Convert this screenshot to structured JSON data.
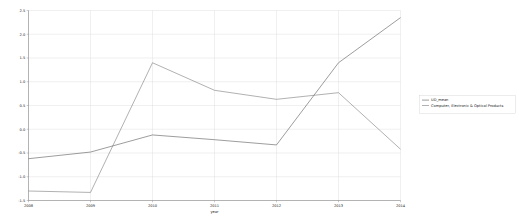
{
  "chart_data": {
    "type": "line",
    "title": "",
    "xlabel": "year",
    "ylabel": "",
    "x": [
      2008,
      2009,
      2010,
      2011,
      2012,
      2013,
      2014
    ],
    "xticklabels": [
      "2008",
      "2009",
      "2010",
      "2011",
      "2012",
      "2013",
      "2014"
    ],
    "xlim": [
      2008,
      2014
    ],
    "ylim": [
      -1.5,
      2.5
    ],
    "yticks": [
      -1.5,
      -1.0,
      -0.5,
      0.0,
      0.5,
      1.0,
      1.5,
      2.0,
      2.5
    ],
    "yticklabels": [
      "-1.5",
      "-1.0",
      "-0.5",
      "0.0",
      "0.5",
      "1.0",
      "1.5",
      "2.0",
      "2.5"
    ],
    "grid": true,
    "legend_position": "right",
    "series": [
      {
        "name": "UD_mean",
        "color": "#4b4b4b",
        "values": [
          -0.62,
          -0.48,
          -0.12,
          -0.22,
          -0.33,
          1.4,
          2.35
        ]
      },
      {
        "name": "Computer, Electronic & Optical Products",
        "color": "#6f6f6f",
        "values": [
          -1.3,
          -1.33,
          1.4,
          0.82,
          0.63,
          0.77,
          -0.42
        ]
      }
    ]
  },
  "legend": {
    "entries": [
      {
        "label": "UD_mean"
      },
      {
        "label": "Computer, Electronic & Optical Products"
      }
    ]
  },
  "axis": {
    "x_title": "year"
  }
}
